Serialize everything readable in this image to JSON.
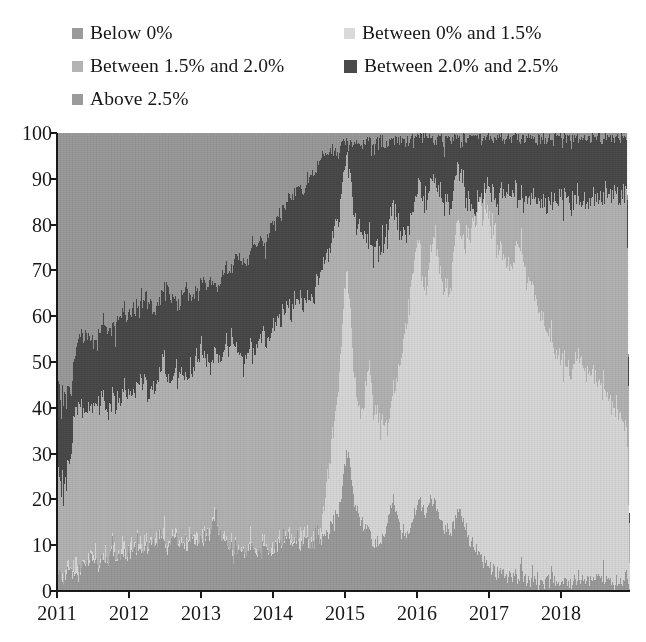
{
  "legend": {
    "rows": [
      [
        {
          "label": "Below 0%",
          "color": "#9b9b9b",
          "swatch": "small"
        },
        {
          "label": "Between 0% and 1.5%",
          "color": "#d9d9d9",
          "swatch": "small"
        }
      ],
      [
        {
          "label": "Between 1.5% and 2.0%",
          "color": "#b4b4b4",
          "swatch": "small"
        },
        {
          "label": "Between 2.0% and 2.5%",
          "color": "#4a4a4a",
          "swatch": "big"
        }
      ],
      [
        {
          "label": "Above 2.5%",
          "color": "#9b9b9b",
          "swatch": "small"
        }
      ]
    ]
  },
  "axes": {
    "y_ticks": [
      "0",
      "10",
      "20",
      "30",
      "40",
      "50",
      "60",
      "70",
      "80",
      "90",
      "100"
    ],
    "x_ticks": [
      "2011",
      "2012",
      "2013",
      "2014",
      "2015",
      "2016",
      "2017",
      "2018"
    ]
  },
  "chart_data": {
    "type": "area",
    "title": "",
    "subtitle": "",
    "xlabel": "",
    "ylabel": "",
    "stacked": true,
    "normalized_percent": true,
    "grid": false,
    "legend_position": "top",
    "xlim": [
      "2011-01-01",
      "2018-12-31"
    ],
    "ylim": [
      0,
      100
    ],
    "ytick_values": [
      0,
      10,
      20,
      30,
      40,
      50,
      60,
      70,
      80,
      90,
      100
    ],
    "xtick_labels": [
      "2011",
      "2012",
      "2013",
      "2014",
      "2015",
      "2016",
      "2017",
      "2018"
    ],
    "series_order_bottom_to_top": [
      "Below 0%",
      "Between 0% and 1.5%",
      "Between 1.5% and 2.0%",
      "Between 2.0% and 2.5%",
      "Above 2.5%"
    ],
    "colors": {
      "Below 0%": "#9b9b9b",
      "Between 0% and 1.5%": "#d9d9d9",
      "Between 1.5% and 2.0%": "#b4b4b4",
      "Between 2.0% and 2.5%": "#4a4a4a",
      "Above 2.5%": "#9b9b9b"
    },
    "x": [
      2011.0,
      2011.04,
      2011.08,
      2011.12,
      2011.17,
      2011.21,
      2011.25,
      2011.29,
      2011.33,
      2011.37,
      2011.42,
      2011.46,
      2011.5,
      2011.54,
      2011.58,
      2011.62,
      2011.67,
      2011.71,
      2011.75,
      2011.79,
      2011.83,
      2011.87,
      2011.92,
      2011.96,
      2012.0,
      2012.04,
      2012.08,
      2012.12,
      2012.17,
      2012.21,
      2012.25,
      2012.29,
      2012.33,
      2012.37,
      2012.42,
      2012.46,
      2012.5,
      2012.54,
      2012.58,
      2012.62,
      2012.67,
      2012.71,
      2012.75,
      2012.79,
      2012.83,
      2012.87,
      2012.92,
      2012.96,
      2013.0,
      2013.04,
      2013.08,
      2013.12,
      2013.17,
      2013.21,
      2013.25,
      2013.29,
      2013.33,
      2013.37,
      2013.42,
      2013.46,
      2013.5,
      2013.54,
      2013.58,
      2013.62,
      2013.67,
      2013.71,
      2013.75,
      2013.79,
      2013.83,
      2013.87,
      2013.92,
      2013.96,
      2014.0,
      2014.04,
      2014.08,
      2014.12,
      2014.17,
      2014.21,
      2014.25,
      2014.29,
      2014.33,
      2014.37,
      2014.42,
      2014.46,
      2014.5,
      2014.54,
      2014.58,
      2014.62,
      2014.67,
      2014.71,
      2014.75,
      2014.79,
      2014.83,
      2014.87,
      2014.92,
      2014.96,
      2015.0,
      2015.04,
      2015.08,
      2015.12,
      2015.17,
      2015.21,
      2015.25,
      2015.29,
      2015.33,
      2015.37,
      2015.42,
      2015.46,
      2015.5,
      2015.54,
      2015.58,
      2015.62,
      2015.67,
      2015.71,
      2015.75,
      2015.79,
      2015.83,
      2015.87,
      2015.92,
      2015.96,
      2016.0,
      2016.04,
      2016.08,
      2016.12,
      2016.17,
      2016.21,
      2016.25,
      2016.29,
      2016.33,
      2016.37,
      2016.42,
      2016.46,
      2016.5,
      2016.54,
      2016.58,
      2016.62,
      2016.67,
      2016.71,
      2016.75,
      2016.79,
      2016.83,
      2016.87,
      2016.92,
      2016.96,
      2017.0,
      2017.04,
      2017.08,
      2017.12,
      2017.17,
      2017.21,
      2017.25,
      2017.29,
      2017.33,
      2017.37,
      2017.42,
      2017.46,
      2017.5,
      2017.54,
      2017.58,
      2017.62,
      2017.67,
      2017.71,
      2017.75,
      2017.79,
      2017.83,
      2017.87,
      2017.92,
      2017.96,
      2018.0,
      2018.04,
      2018.08,
      2018.12,
      2018.17,
      2018.21,
      2018.25,
      2018.29,
      2018.33,
      2018.37,
      2018.42,
      2018.46,
      2018.5,
      2018.54,
      2018.58,
      2018.62,
      2018.67,
      2018.71,
      2018.75,
      2018.79,
      2018.83,
      2018.87,
      2018.92
    ],
    "series": [
      {
        "name": "Below 0%",
        "values": [
          2,
          3,
          3,
          4,
          6,
          5,
          4,
          3,
          4,
          6,
          5,
          6,
          7,
          6,
          5,
          6,
          7,
          8,
          9,
          8,
          7,
          8,
          9,
          8,
          8,
          9,
          10,
          9,
          9,
          10,
          9,
          10,
          11,
          10,
          11,
          12,
          11,
          10,
          11,
          12,
          11,
          10,
          11,
          10,
          11,
          12,
          11,
          10,
          11,
          12,
          13,
          12,
          14,
          16,
          13,
          12,
          11,
          10,
          9,
          8,
          9,
          8,
          9,
          8,
          9,
          10,
          9,
          8,
          9,
          10,
          9,
          8,
          9,
          10,
          11,
          10,
          11,
          12,
          11,
          10,
          11,
          10,
          11,
          12,
          11,
          10,
          11,
          12,
          11,
          12,
          13,
          14,
          15,
          16,
          18,
          22,
          27,
          31,
          26,
          21,
          18,
          16,
          15,
          14,
          13,
          12,
          11,
          10,
          11,
          12,
          14,
          17,
          19,
          17,
          15,
          13,
          12,
          13,
          14,
          16,
          18,
          20,
          19,
          17,
          19,
          21,
          20,
          18,
          16,
          15,
          14,
          13,
          14,
          16,
          18,
          17,
          15,
          13,
          12,
          11,
          10,
          9,
          8,
          7,
          6,
          5,
          5,
          4,
          4,
          4,
          3,
          3,
          3,
          3,
          3,
          3,
          3,
          3,
          2,
          2,
          2,
          2,
          2,
          2,
          2,
          2,
          2,
          2,
          2,
          2,
          2,
          2,
          2,
          2,
          2,
          2,
          2,
          2,
          2,
          2,
          2,
          2,
          2,
          2,
          2,
          2,
          2,
          2,
          2,
          2,
          3
        ]
      },
      {
        "name": "Between 0% and 1.5%",
        "values": [
          0,
          0,
          0,
          0,
          0,
          0,
          0,
          0,
          0,
          0,
          0,
          0,
          0,
          0,
          0,
          0,
          0,
          0,
          0,
          0,
          0,
          0,
          0,
          0,
          0,
          0,
          0,
          0,
          0,
          0,
          0,
          0,
          0,
          0,
          0,
          0,
          0,
          0,
          0,
          0,
          0,
          0,
          0,
          0,
          0,
          0,
          0,
          0,
          0,
          0,
          0,
          0,
          0,
          0,
          0,
          0,
          0,
          0,
          0,
          0,
          0,
          0,
          0,
          0,
          0,
          0,
          0,
          0,
          0,
          0,
          0,
          0,
          0,
          0,
          0,
          0,
          0,
          0,
          0,
          0,
          0,
          0,
          0,
          0,
          0,
          0,
          0,
          0,
          2,
          5,
          10,
          14,
          18,
          23,
          28,
          34,
          40,
          38,
          33,
          28,
          25,
          24,
          26,
          30,
          36,
          34,
          30,
          28,
          26,
          24,
          22,
          20,
          24,
          28,
          33,
          38,
          44,
          48,
          52,
          55,
          58,
          54,
          50,
          48,
          52,
          56,
          60,
          58,
          55,
          52,
          50,
          54,
          58,
          62,
          65,
          63,
          66,
          70,
          74,
          76,
          78,
          80,
          81,
          80,
          78,
          76,
          74,
          72,
          70,
          69,
          68,
          67,
          68,
          70,
          72,
          71,
          69,
          67,
          65,
          63,
          61,
          59,
          57,
          55,
          53,
          51,
          50,
          49,
          48,
          47,
          46,
          46,
          47,
          48,
          49,
          48,
          47,
          46,
          45,
          44,
          43,
          42,
          41,
          40,
          39,
          38,
          37,
          36,
          35,
          34,
          33
        ]
      },
      {
        "name": "Between 1.5% and 2.0%",
        "values": [
          22,
          20,
          18,
          19,
          24,
          28,
          32,
          35,
          36,
          34,
          33,
          32,
          31,
          33,
          35,
          36,
          34,
          32,
          31,
          33,
          35,
          34,
          33,
          34,
          35,
          33,
          32,
          34,
          36,
          35,
          34,
          33,
          32,
          34,
          36,
          38,
          37,
          36,
          35,
          34,
          36,
          38,
          37,
          36,
          35,
          36,
          38,
          40,
          42,
          40,
          38,
          37,
          36,
          35,
          37,
          39,
          41,
          43,
          45,
          46,
          44,
          42,
          41,
          43,
          45,
          44,
          43,
          45,
          47,
          46,
          45,
          47,
          49,
          48,
          47,
          49,
          51,
          50,
          49,
          51,
          53,
          52,
          51,
          53,
          55,
          54,
          53,
          55,
          56,
          54,
          50,
          47,
          44,
          41,
          37,
          32,
          27,
          25,
          30,
          35,
          38,
          40,
          38,
          34,
          28,
          30,
          34,
          36,
          38,
          40,
          42,
          44,
          40,
          36,
          31,
          26,
          21,
          18,
          15,
          13,
          11,
          14,
          18,
          20,
          17,
          14,
          11,
          13,
          16,
          19,
          21,
          18,
          15,
          12,
          10,
          12,
          10,
          7,
          4,
          3,
          2,
          2,
          2,
          3,
          5,
          7,
          9,
          11,
          13,
          14,
          15,
          16,
          15,
          13,
          11,
          12,
          14,
          16,
          18,
          20,
          22,
          24,
          26,
          28,
          30,
          32,
          33,
          34,
          35,
          36,
          37,
          37,
          36,
          35,
          34,
          35,
          36,
          37,
          38,
          39,
          40,
          41,
          42,
          43,
          44,
          45,
          46,
          47,
          48,
          49,
          50
        ]
      },
      {
        "name": "Between 2.0% and 2.5%",
        "values": [
          17,
          19,
          20,
          18,
          14,
          12,
          13,
          15,
          16,
          15,
          17,
          16,
          15,
          14,
          16,
          15,
          17,
          18,
          16,
          15,
          17,
          19,
          18,
          17,
          16,
          18,
          19,
          17,
          16,
          18,
          20,
          19,
          18,
          17,
          16,
          15,
          17,
          19,
          18,
          17,
          16,
          15,
          17,
          19,
          18,
          17,
          16,
          15,
          14,
          16,
          15,
          17,
          16,
          15,
          14,
          16,
          18,
          17,
          16,
          18,
          20,
          22,
          21,
          20,
          19,
          21,
          23,
          22,
          21,
          20,
          22,
          24,
          23,
          22,
          24,
          23,
          22,
          24,
          26,
          25,
          24,
          26,
          25,
          24,
          26,
          28,
          27,
          26,
          25,
          24,
          22,
          21,
          19,
          16,
          13,
          10,
          5,
          4,
          9,
          14,
          17,
          18,
          19,
          20,
          21,
          22,
          23,
          24,
          23,
          22,
          20,
          17,
          15,
          17,
          19,
          21,
          21,
          19,
          17,
          15,
          12,
          11,
          12,
          14,
          11,
          8,
          8,
          10,
          12,
          13,
          14,
          14,
          12,
          9,
          6,
          7,
          13,
          16,
          17,
          17,
          16,
          14,
          13,
          13,
          12,
          12,
          12,
          12,
          12,
          11,
          12,
          12,
          12,
          12,
          12,
          12,
          13,
          13,
          14,
          14,
          14,
          15,
          15,
          15,
          15,
          14,
          14,
          14,
          13,
          13,
          13,
          13,
          13,
          13,
          13,
          13,
          13,
          13,
          13,
          13,
          13,
          13,
          12,
          12,
          12,
          12,
          12,
          12,
          12,
          12,
          12
        ]
      },
      {
        "name": "Above 2.5%",
        "values": [
          59,
          58,
          59,
          59,
          56,
          55,
          51,
          47,
          44,
          45,
          45,
          46,
          47,
          47,
          44,
          43,
          42,
          42,
          44,
          44,
          41,
          39,
          40,
          41,
          41,
          40,
          39,
          40,
          39,
          37,
          37,
          38,
          39,
          39,
          37,
          35,
          35,
          35,
          36,
          37,
          37,
          37,
          35,
          35,
          36,
          35,
          35,
          35,
          33,
          32,
          34,
          34,
          34,
          34,
          36,
          33,
          30,
          30,
          30,
          28,
          27,
          28,
          29,
          29,
          27,
          25,
          25,
          25,
          23,
          24,
          24,
          21,
          19,
          20,
          18,
          18,
          16,
          14,
          14,
          14,
          12,
          12,
          13,
          11,
          8,
          8,
          9,
          7,
          6,
          5,
          5,
          4,
          4,
          4,
          4,
          2,
          1,
          2,
          2,
          2,
          2,
          2,
          2,
          2,
          2,
          2,
          2,
          2,
          2,
          2,
          2,
          2,
          2,
          2,
          2,
          2,
          2,
          2,
          2,
          1,
          1,
          1,
          1,
          1,
          1,
          1,
          1,
          1,
          1,
          1,
          1,
          1,
          1,
          1,
          1,
          1,
          1,
          1,
          1,
          1,
          1,
          1,
          1,
          1,
          1,
          1,
          1,
          1,
          1,
          1,
          1,
          1,
          1,
          1,
          1,
          1,
          1,
          1,
          1,
          1,
          1,
          1,
          1,
          1,
          1,
          1,
          1,
          1,
          1,
          1,
          1,
          1,
          1,
          1,
          1,
          1,
          1,
          1,
          1,
          1,
          1,
          1,
          1,
          1,
          1,
          1,
          1,
          1,
          1,
          1,
          1
        ]
      }
    ]
  }
}
